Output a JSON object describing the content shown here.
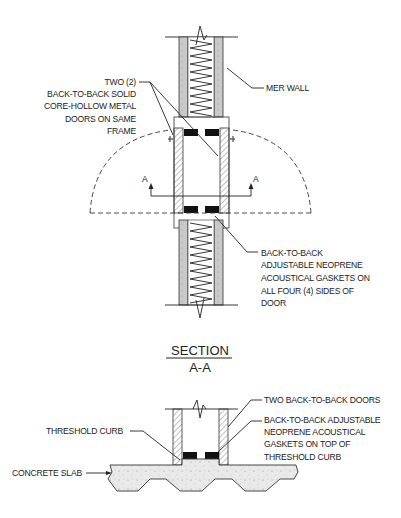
{
  "labels": {
    "doors": [
      "TWO (2)",
      "BACK-TO-BACK SOLID",
      "CORE-HOLLOW METAL",
      "DOORS ON SAME",
      "FRAME"
    ],
    "mer_wall": "MER WALL",
    "gaskets": [
      "BACK-TO-BACK",
      "ADJUSTABLE NEOPRENE",
      "ACOUSTICAL GASKETS ON",
      "ALL FOUR (4) SIDES OF",
      "DOOR"
    ],
    "section_marker_left": "A",
    "section_marker_right": "A",
    "section_title": "SECTION",
    "section_subtitle": "A-A",
    "two_doors": "TWO BACK-TO-BACK DOORS",
    "threshold_gaskets": [
      "BACK-TO-BACK ADJUSTABLE",
      "NEOPRENE ACOUSTICAL",
      "GASKETS ON TOP OF",
      "THRESHOLD CURB"
    ],
    "threshold_curb": "THRESHOLD CURB",
    "concrete_slab": "CONCRETE SLAB"
  }
}
